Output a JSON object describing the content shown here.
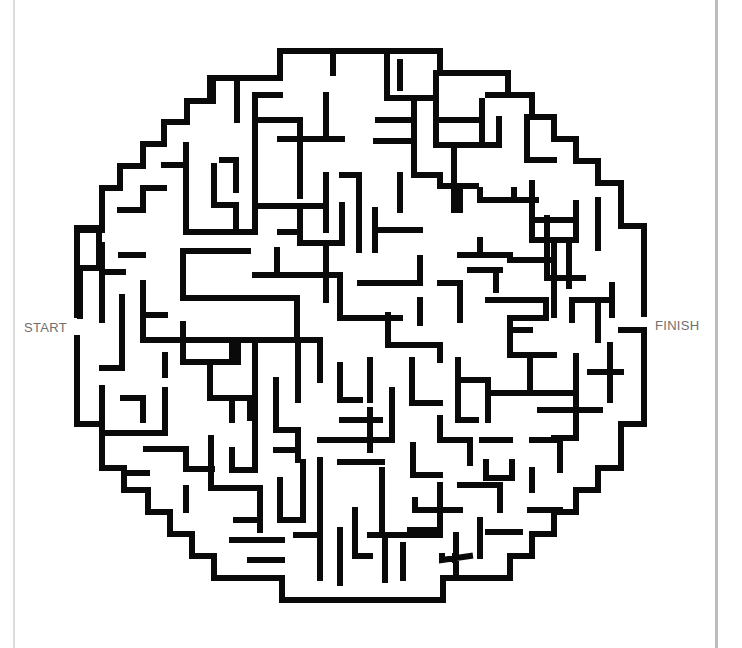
{
  "puzzle": {
    "type": "circular maze",
    "start_label": "START",
    "finish_label": "FINISH",
    "wall_color": "#0a0a0a",
    "background_color": "#ffffff",
    "label_color": "#6f6f6f"
  }
}
